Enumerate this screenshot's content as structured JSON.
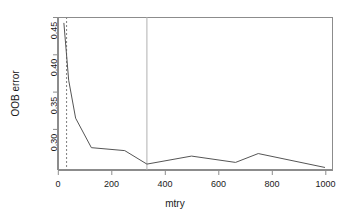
{
  "chart_data": {
    "type": "line",
    "title": "",
    "xlabel": "mtry",
    "ylabel": "OOB error",
    "xlim": [
      0,
      1030
    ],
    "ylim": [
      0.2685,
      0.45
    ],
    "grid": false,
    "legend": null,
    "x_ticks": [
      0,
      200,
      400,
      600,
      800,
      1000
    ],
    "x_tick_labels": [
      "0",
      "200",
      "400",
      "600",
      "800",
      "1000"
    ],
    "y_ticks": [
      0.3,
      0.35,
      0.4,
      0.45
    ],
    "y_tick_labels": [
      "0.30",
      "0.35",
      "0.40",
      "0.45"
    ],
    "series": [
      {
        "name": "OOB error",
        "color": "#555555",
        "x": [
          22,
          40,
          66,
          125,
          250,
          333,
          500,
          665,
          750,
          1000
        ],
        "y": [
          0.443,
          0.375,
          0.33,
          0.295,
          0.2915,
          0.2755,
          0.285,
          0.2775,
          0.288,
          0.2715
        ]
      }
    ],
    "annotations": [
      {
        "kind": "vline",
        "name": "dashed-reference-line",
        "x": 32,
        "style": "dashed",
        "color": "#888888"
      },
      {
        "kind": "vline",
        "name": "optimum-reference-line",
        "x": 333,
        "style": "solid",
        "color": "#b0b0b0"
      }
    ]
  }
}
